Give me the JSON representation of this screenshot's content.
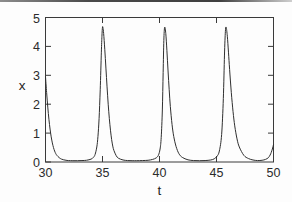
{
  "chart_data": {
    "type": "line",
    "title": "",
    "subtitle": "",
    "xlabel": "t",
    "ylabel": "x",
    "xlim": [
      30,
      50
    ],
    "ylim": [
      0,
      5
    ],
    "xticks": [
      30,
      35,
      40,
      45,
      50
    ],
    "yticks": [
      0,
      1,
      2,
      3,
      4,
      5
    ],
    "xtick_labels": [
      "30",
      "35",
      "40",
      "45",
      "50"
    ],
    "ytick_labels": [
      "0",
      "1",
      "2",
      "3",
      "4",
      "5"
    ],
    "grid": false,
    "legend": null,
    "annotations": [],
    "line_color": "#2f2f2f",
    "background_color": "#fdfdfd",
    "axis_color": "#3a3a3a",
    "peak_amplitude": 4.67,
    "baseline": 0.03,
    "period": 5.35,
    "peak_times": [
      35.0,
      40.35,
      45.7
    ],
    "series": [
      {
        "name": "x(t)",
        "x": [
          30.0,
          30.1,
          30.2,
          30.3,
          30.4,
          30.5,
          30.6,
          30.7,
          30.8,
          30.9,
          31.0,
          31.2,
          31.4,
          31.6,
          31.8,
          32.0,
          32.4,
          32.8,
          33.2,
          33.6,
          34.0,
          34.2,
          34.35,
          34.5,
          34.6,
          34.7,
          34.8,
          34.9,
          34.95,
          35.0,
          35.05,
          35.1,
          35.2,
          35.3,
          35.4,
          35.5,
          35.6,
          35.7,
          35.8,
          35.9,
          36.0,
          36.2,
          36.4,
          36.8,
          37.2,
          37.6,
          38.0,
          38.5,
          39.0,
          39.4,
          39.7,
          39.9,
          40.05,
          40.15,
          40.25,
          40.32,
          40.38,
          40.45,
          40.55,
          40.65,
          40.75,
          40.85,
          40.95,
          41.1,
          41.25,
          41.45,
          41.7,
          42.0,
          42.5,
          43.0,
          43.5,
          44.0,
          44.5,
          44.8,
          45.05,
          45.25,
          45.45,
          45.6,
          45.7,
          45.78,
          45.85,
          45.95,
          46.05,
          46.15,
          46.3,
          46.45,
          46.6,
          46.8,
          47.0,
          47.4,
          47.8,
          48.2,
          48.6,
          49.0,
          49.3,
          49.55,
          49.7,
          49.8,
          49.9,
          50.0
        ],
        "y": [
          2.95,
          2.4,
          1.9,
          1.48,
          1.14,
          0.87,
          0.66,
          0.5,
          0.38,
          0.29,
          0.23,
          0.15,
          0.1,
          0.075,
          0.06,
          0.05,
          0.045,
          0.045,
          0.05,
          0.06,
          0.1,
          0.16,
          0.26,
          0.52,
          0.88,
          1.5,
          2.5,
          3.8,
          4.35,
          4.67,
          4.62,
          4.45,
          3.9,
          3.25,
          2.6,
          2.0,
          1.5,
          1.1,
          0.78,
          0.55,
          0.4,
          0.22,
          0.13,
          0.07,
          0.05,
          0.045,
          0.045,
          0.05,
          0.06,
          0.09,
          0.14,
          0.23,
          0.45,
          0.85,
          1.8,
          3.1,
          4.2,
          4.66,
          4.45,
          3.85,
          3.15,
          2.5,
          1.92,
          1.3,
          0.88,
          0.54,
          0.29,
          0.16,
          0.075,
          0.05,
          0.045,
          0.05,
          0.07,
          0.11,
          0.2,
          0.38,
          0.95,
          2.2,
          3.7,
          4.52,
          4.66,
          4.35,
          3.8,
          3.2,
          2.4,
          1.75,
          1.25,
          0.8,
          0.52,
          0.23,
          0.12,
          0.07,
          0.05,
          0.06,
          0.09,
          0.15,
          0.24,
          0.33,
          0.45,
          0.6
        ]
      }
    ]
  },
  "axis_titles": {
    "x": "t",
    "y": "x"
  }
}
